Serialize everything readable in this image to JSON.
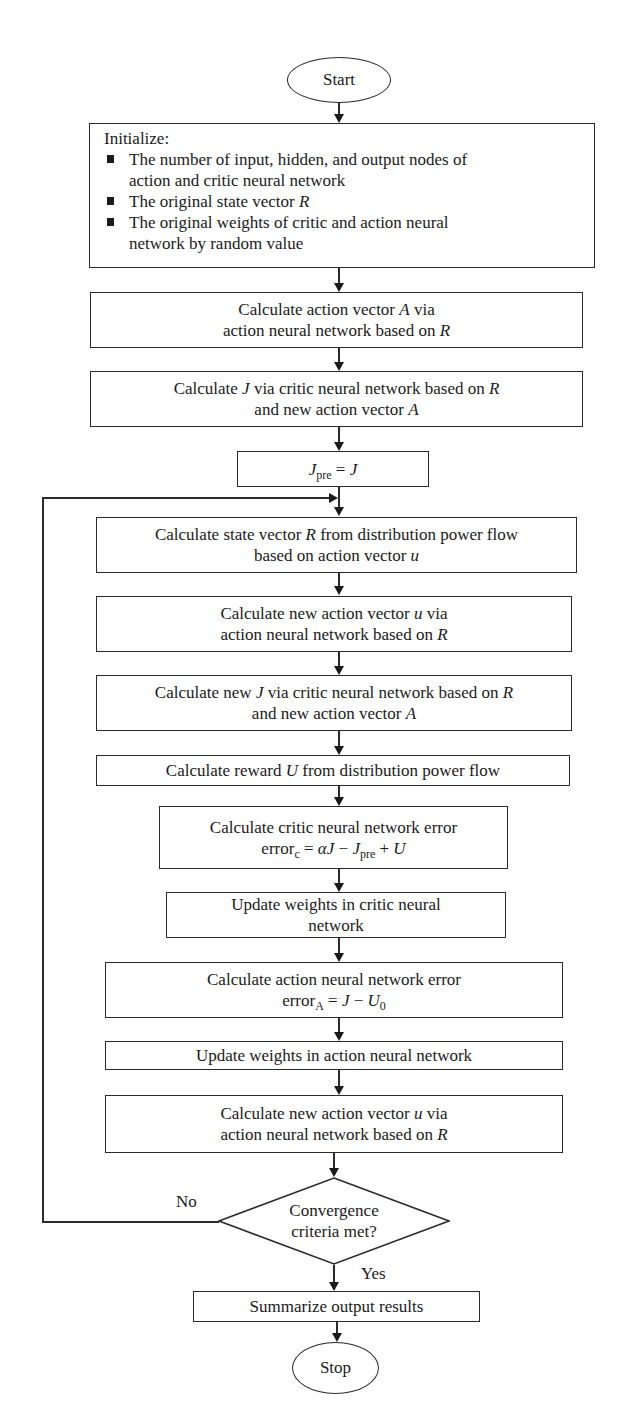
{
  "flowchart": {
    "start": "Start",
    "stop": "Stop",
    "initialize": {
      "header": "Initialize:",
      "items": [
        [
          "The number of input, hidden, and output nodes of",
          "action and critic neural network"
        ],
        [
          "The original state vector "
        ],
        [
          "The original weights of critic and action neural",
          "network by random value"
        ]
      ],
      "item2_var": "R"
    },
    "steps": {
      "calc_action_A": {
        "l1a": "Calculate action vector ",
        "l1v": "A",
        "l1b": " via",
        "l2a": "action neural network based on ",
        "l2v": "R"
      },
      "calc_J": {
        "l1a": "Calculate ",
        "l1v": "J",
        "l1b": " via critic neural network based on ",
        "l1v2": "R",
        "l2a": "and new action vector ",
        "l2v": "A"
      },
      "jpre_assign": {
        "lhs": "J",
        "lhs_sub": "pre",
        "eq": " = ",
        "rhs": "J"
      },
      "calc_state_R": {
        "l1a": "Calculate state vector ",
        "l1v": "R",
        "l1b": " from distribution power flow",
        "l2a": "based on action vector ",
        "l2v": "u"
      },
      "calc_new_action_u": {
        "l1a": "Calculate new action vector ",
        "l1v": "u",
        "l1b": " via",
        "l2a": "action neural network based on ",
        "l2v": "R"
      },
      "calc_new_J": {
        "l1a": "Calculate new ",
        "l1v": "J",
        "l1b": " via critic neural network based on ",
        "l1v2": "R",
        "l2a": "and new action vector ",
        "l2v": "A"
      },
      "calc_reward": {
        "l1a": "Calculate reward ",
        "l1v": "U",
        "l1b": " from distribution power flow"
      },
      "critic_error": {
        "l1": "Calculate critic neural network error",
        "err": "error",
        "err_sub": "c",
        "formula_a": " = ",
        "alpha": "αJ",
        "minus": " − ",
        "jpre": "J",
        "jpre_sub": "pre",
        "plus": " + ",
        "u": "U"
      },
      "update_critic": {
        "l1": "Update weights in critic neural",
        "l2": "network"
      },
      "action_error": {
        "l1": "Calculate action neural network error",
        "err": "error",
        "err_sub": "A",
        "eq": " = ",
        "j": "J",
        "minus": " − ",
        "u0": "U",
        "u0_sub": "0"
      },
      "update_action": {
        "l1": "Update weights in action neural network"
      },
      "calc_new_action_u2": {
        "l1a": "Calculate new action vector ",
        "l1v": "u",
        "l1b": " via",
        "l2a": "action neural network based on ",
        "l2v": "R"
      },
      "summarize": {
        "l1": "Summarize output results"
      }
    },
    "decision": {
      "l1": "Convergence",
      "l2": "criteria met?",
      "no_label": "No",
      "yes_label": "Yes"
    }
  }
}
